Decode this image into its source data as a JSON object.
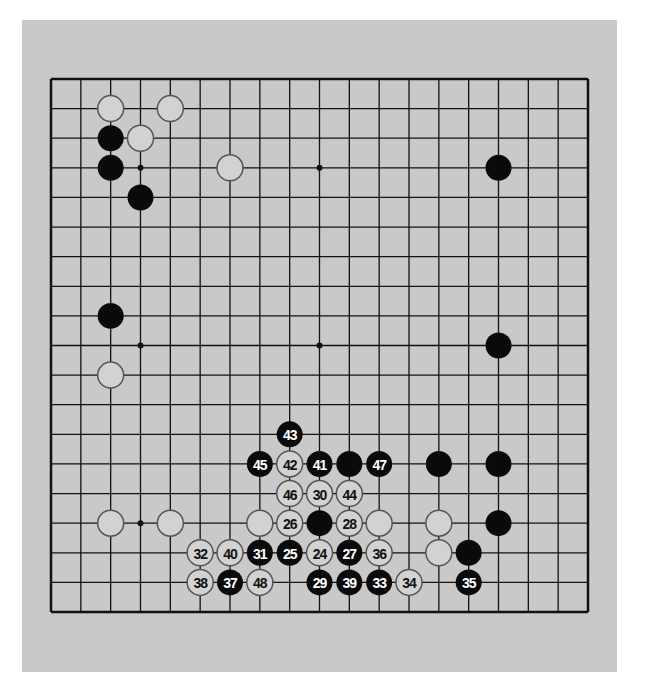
{
  "game": {
    "type": "go",
    "board_size": 19,
    "colors": {
      "panel": "#c9c9c9",
      "board_bg": "#c9c9c9",
      "line": "#111111",
      "black_stone": "#0a0a0a",
      "white_stone_fill": "#d2d2d2",
      "white_stone_stroke": "#555555",
      "black_label": "#ffffff",
      "white_label": "#111111"
    },
    "star_points": [
      [
        3,
        3
      ],
      [
        9,
        3
      ],
      [
        15,
        3
      ],
      [
        3,
        9
      ],
      [
        9,
        9
      ],
      [
        15,
        9
      ],
      [
        3,
        15
      ],
      [
        9,
        15
      ],
      [
        15,
        15
      ]
    ],
    "stones": [
      {
        "col": 2,
        "row": 1,
        "color": "white",
        "label": ""
      },
      {
        "col": 4,
        "row": 1,
        "color": "white",
        "label": ""
      },
      {
        "col": 2,
        "row": 2,
        "color": "black",
        "label": ""
      },
      {
        "col": 3,
        "row": 2,
        "color": "white",
        "label": ""
      },
      {
        "col": 2,
        "row": 3,
        "color": "black",
        "label": ""
      },
      {
        "col": 6,
        "row": 3,
        "color": "white",
        "label": ""
      },
      {
        "col": 15,
        "row": 3,
        "color": "black",
        "label": ""
      },
      {
        "col": 3,
        "row": 4,
        "color": "black",
        "label": ""
      },
      {
        "col": 2,
        "row": 8,
        "color": "black",
        "label": ""
      },
      {
        "col": 15,
        "row": 9,
        "color": "black",
        "label": ""
      },
      {
        "col": 2,
        "row": 10,
        "color": "white",
        "label": ""
      },
      {
        "col": 8,
        "row": 12,
        "color": "black",
        "label": "43"
      },
      {
        "col": 7,
        "row": 13,
        "color": "black",
        "label": "45"
      },
      {
        "col": 8,
        "row": 13,
        "color": "white",
        "label": "42"
      },
      {
        "col": 9,
        "row": 13,
        "color": "black",
        "label": "41"
      },
      {
        "col": 10,
        "row": 13,
        "color": "black",
        "label": ""
      },
      {
        "col": 11,
        "row": 13,
        "color": "black",
        "label": "47"
      },
      {
        "col": 13,
        "row": 13,
        "color": "black",
        "label": ""
      },
      {
        "col": 15,
        "row": 13,
        "color": "black",
        "label": ""
      },
      {
        "col": 8,
        "row": 14,
        "color": "white",
        "label": "46"
      },
      {
        "col": 9,
        "row": 14,
        "color": "white",
        "label": "30"
      },
      {
        "col": 10,
        "row": 14,
        "color": "white",
        "label": "44"
      },
      {
        "col": 2,
        "row": 15,
        "color": "white",
        "label": ""
      },
      {
        "col": 4,
        "row": 15,
        "color": "white",
        "label": ""
      },
      {
        "col": 7,
        "row": 15,
        "color": "white",
        "label": ""
      },
      {
        "col": 8,
        "row": 15,
        "color": "white",
        "label": "26"
      },
      {
        "col": 9,
        "row": 15,
        "color": "black",
        "label": ""
      },
      {
        "col": 10,
        "row": 15,
        "color": "white",
        "label": "28"
      },
      {
        "col": 11,
        "row": 15,
        "color": "white",
        "label": ""
      },
      {
        "col": 13,
        "row": 15,
        "color": "white",
        "label": ""
      },
      {
        "col": 15,
        "row": 15,
        "color": "black",
        "label": ""
      },
      {
        "col": 5,
        "row": 16,
        "color": "white",
        "label": "32"
      },
      {
        "col": 6,
        "row": 16,
        "color": "white",
        "label": "40"
      },
      {
        "col": 7,
        "row": 16,
        "color": "black",
        "label": "31"
      },
      {
        "col": 8,
        "row": 16,
        "color": "black",
        "label": "25"
      },
      {
        "col": 9,
        "row": 16,
        "color": "white",
        "label": "24"
      },
      {
        "col": 10,
        "row": 16,
        "color": "black",
        "label": "27"
      },
      {
        "col": 11,
        "row": 16,
        "color": "white",
        "label": "36"
      },
      {
        "col": 13,
        "row": 16,
        "color": "white",
        "label": ""
      },
      {
        "col": 14,
        "row": 16,
        "color": "black",
        "label": ""
      },
      {
        "col": 5,
        "row": 17,
        "color": "white",
        "label": "38"
      },
      {
        "col": 6,
        "row": 17,
        "color": "black",
        "label": "37"
      },
      {
        "col": 7,
        "row": 17,
        "color": "white",
        "label": "48"
      },
      {
        "col": 9,
        "row": 17,
        "color": "black",
        "label": "29"
      },
      {
        "col": 10,
        "row": 17,
        "color": "black",
        "label": "39"
      },
      {
        "col": 11,
        "row": 17,
        "color": "black",
        "label": "33"
      },
      {
        "col": 12,
        "row": 17,
        "color": "white",
        "label": "34"
      },
      {
        "col": 14,
        "row": 17,
        "color": "black",
        "label": "35"
      }
    ]
  }
}
